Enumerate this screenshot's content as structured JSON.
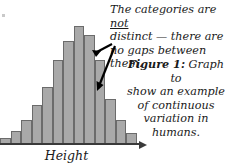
{
  "figure": {
    "axis_label": "Height",
    "callout": {
      "line1_pre": "The categories are ",
      "line1_emph": "not",
      "line2": "distinct — there are",
      "line3": "no gaps between them."
    },
    "caption": {
      "lead": "Figure 1:",
      "line1_rest": " Graph to",
      "line2": "show an example",
      "line3": "of continuous",
      "line4": "variation in humans."
    }
  },
  "colors": {
    "bar_fill": "#a9a9a9",
    "bar_stroke": "#6b6b6b",
    "axis": "#3a3a3a",
    "text": "#1a1a1a",
    "background": "#ffffff"
  },
  "chart_data": {
    "type": "bar",
    "title": "",
    "xlabel": "Height",
    "ylabel": "",
    "grid": false,
    "legend": null,
    "bar_gap": 0,
    "categories": [
      "1",
      "2",
      "3",
      "4",
      "5",
      "6",
      "7",
      "8",
      "9",
      "10",
      "11",
      "12",
      "13"
    ],
    "values": [
      5,
      11,
      20,
      33,
      48,
      71,
      87,
      100,
      92,
      71,
      38,
      20,
      9
    ],
    "ylim": [
      0,
      100
    ],
    "annotations": [
      "The categories are not distinct — there are no gaps between them.",
      "Figure 1: Graph to show an example of continuous variation in humans."
    ]
  }
}
